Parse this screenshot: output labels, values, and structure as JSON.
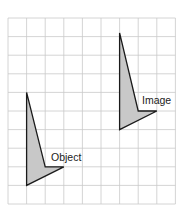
{
  "grid": {
    "origin_x": 8,
    "origin_y": 18,
    "cell": 18.6,
    "columns": 9,
    "rows": 10,
    "line_color": "#c9c9c9"
  },
  "shapes": {
    "object": {
      "label": "Object",
      "fill": "#c8c8c8",
      "stroke": "#1a1a1a",
      "points_grid": [
        [
          1,
          4
        ],
        [
          2,
          8
        ],
        [
          3,
          8
        ],
        [
          1,
          9
        ]
      ]
    },
    "image": {
      "label": "Image",
      "fill": "#c8c8c8",
      "stroke": "#1a1a1a",
      "points_grid": [
        [
          6,
          0.8
        ],
        [
          7,
          5
        ],
        [
          8,
          5
        ],
        [
          6,
          6
        ]
      ]
    }
  },
  "labels": {
    "object": "Object",
    "image": "Image"
  }
}
